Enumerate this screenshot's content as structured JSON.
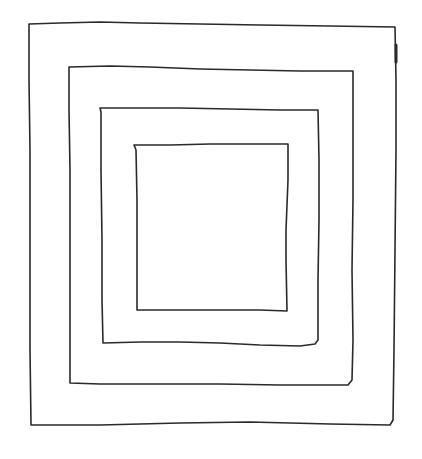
{
  "drawing": {
    "description": "Hand-drawn sketch of four nested concentric squares",
    "stroke_color": "#2a2a2a",
    "background": "#ffffff",
    "squares": [
      {
        "name": "outer",
        "d": "M29,24 L60,23 L100,22 L140,23 L200,24 L260,25 L330,26 L395,27 L396,80 L396,150 L395,250 L394,350 L393,420 L390,425 L330,424 L250,422 L180,423 L100,425 L31,425 L30,350 L30,250 L30,150 L29,80 Z"
      },
      {
        "name": "second",
        "d": "M69,67 L110,66 L150,67 L200,69 L250,70 L300,71 L353,71 L353,130 L353,200 L352,270 L353,340 L352,380 L348,385 L280,385 L220,384 L160,384 L100,384 L70,383 L70,320 L70,250 L70,170 L69,110 Z"
      },
      {
        "name": "third",
        "d": "M100,108 L140,108 L180,108 L230,109 L280,110 L318,110 L319,160 L319,220 L318,280 L318,340 L315,344 L300,346 L260,345 L220,343 L180,342 L140,342 L103,343 L102,300 L102,240 L101,170 L101,112 Z"
      },
      {
        "name": "inner",
        "d": "M134,145 L170,145 L210,144 L250,144 L288,144 L288,180 L286,230 L286,260 L287,311 L260,310 L220,310 L180,310 L137,310 L137,260 L137,200 L136,150 Z"
      }
    ],
    "mark": {
      "name": "thick-stroke-mark",
      "d": "M396,45 L396,62"
    }
  }
}
